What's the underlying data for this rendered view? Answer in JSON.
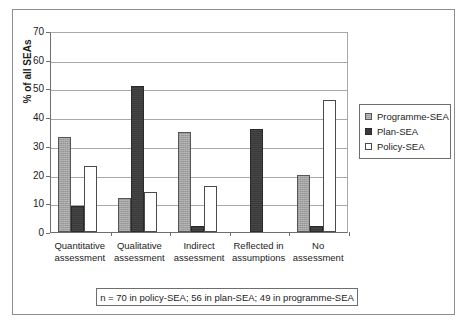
{
  "chart_data": {
    "type": "bar",
    "title": "",
    "xlabel": "",
    "ylabel": "% of all SEAs",
    "ylim": [
      0,
      70
    ],
    "yticks": [
      0,
      10,
      20,
      30,
      40,
      50,
      60,
      70
    ],
    "grid": true,
    "legend_position": "right",
    "categories": [
      "Quantitative assessment",
      "Qualitative assessment",
      "Indirect assessment",
      "Reflected in assumptions",
      "No assessment"
    ],
    "category_lines": [
      [
        "Quantitative",
        "assessment"
      ],
      [
        "Qualitative",
        "assessment"
      ],
      [
        "Indirect",
        "assessment"
      ],
      [
        "Reflected in",
        "assumptions"
      ],
      [
        "No",
        "assessment"
      ]
    ],
    "series": [
      {
        "name": "Programme-SEA",
        "color": "#a2a2a2",
        "values": [
          33,
          12,
          35,
          0,
          20
        ]
      },
      {
        "name": "Plan-SEA",
        "color": "#3a3a3a",
        "values": [
          9,
          51,
          2,
          36,
          2
        ]
      },
      {
        "name": "Policy-SEA",
        "color": "#ffffff",
        "values": [
          23,
          14,
          16,
          0,
          46
        ]
      }
    ],
    "annotations": [
      "n = 70 in policy-SEA; 56 in plan-SEA; 49 in programme-SEA"
    ]
  },
  "legend": {
    "items": [
      {
        "label": "Programme-SEA",
        "swatch": "programme"
      },
      {
        "label": "Plan-SEA",
        "swatch": "plan"
      },
      {
        "label": "Policy-SEA",
        "swatch": "policy"
      }
    ]
  },
  "caption": {
    "text": "n = 70 in policy-SEA; 56 in plan-SEA; 49 in programme-SEA"
  },
  "axis": {
    "y_title": "% of all SEAs",
    "y_labels": [
      "70",
      "60",
      "50",
      "40",
      "30",
      "20",
      "10",
      "0"
    ]
  }
}
